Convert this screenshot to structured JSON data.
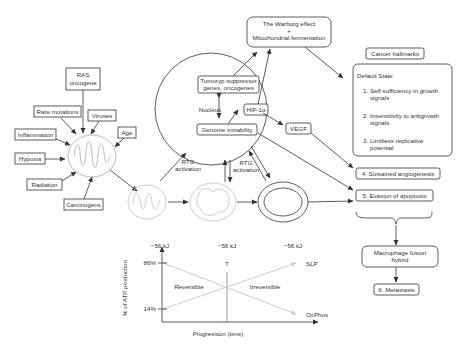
{
  "factors": {
    "ras": [
      "RAS",
      "oncogene"
    ],
    "rare_mutations": "Rare mutations",
    "viruses": "Viruses",
    "inflammation": "Inflammation",
    "age": "Age",
    "hypoxia": "Hypoxia",
    "radiation": "Radiation",
    "carcinogens": "Carcinogens"
  },
  "warburg": {
    "line1": "The Warburg effect",
    "line2": "+",
    "line3": "Mitochondrial fermentation"
  },
  "nucleus": {
    "label": "Nucleus",
    "tumor_genes": [
      "Tumoryp suppressor",
      "genes, oncogenes"
    ],
    "genome_instability": "Genome instability",
    "hif": "HIF-1α"
  },
  "vegf": "VEGF",
  "rtg": {
    "left": [
      "RTG",
      "activation"
    ],
    "right": [
      "RTG",
      "activation"
    ]
  },
  "hallmarks": {
    "title": "Cancer hallmarks",
    "default_state": "Default State",
    "items": [
      [
        "1. Self-sufficiency in growth",
        "signals"
      ],
      [
        "2. Insensitivity to antigrowth",
        "signals"
      ],
      [
        "3. Limitless replicative",
        "potential"
      ]
    ],
    "angiogenesis": "4. Sustained angiogenesis",
    "apoptosis": "5. Evasion of apoptosis",
    "fusion": [
      "Macrophage fusion",
      "hybrid"
    ],
    "metastasis": "6. Metastasis"
  },
  "graph": {
    "top_labels": [
      "−56 kJ",
      "−56 kJ",
      "−56 kJ"
    ],
    "y_high": "86%",
    "y_low": "14%",
    "ylabel": "% of ATP production",
    "xlabel": "Progression (time)",
    "threshold": "T",
    "reversible": "Reversible",
    "irreversible": "Irreversible",
    "slp": "SLP",
    "oxphos": "OxPhos"
  }
}
